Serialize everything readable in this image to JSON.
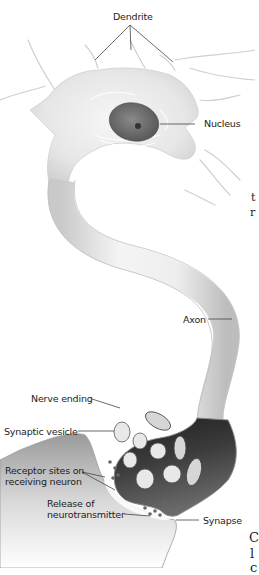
{
  "diagram": {
    "labels": {
      "dendrite": "Dendrite",
      "nucleus": "Nucleus",
      "axon": "Axon",
      "nerve_ending": "Nerve ending",
      "synaptic_vesicle": "Synaptic vesicle",
      "receptor_sites_line1": "Receptor sites on",
      "receptor_sites_line2": "receiving neuron",
      "release_line1": "Release of",
      "release_line2": "neurotransmitter",
      "synapse": "Synapse"
    },
    "edge_text_fragments": [
      "t",
      "r",
      "C",
      "l",
      "c"
    ],
    "colors": {
      "background": "#ffffff",
      "cell_body": "#ececec",
      "cell_shade": "#c8c8c8",
      "nucleus": "#6e6e6e",
      "nerve_ending_dark": "#3a3a3a",
      "vesicle": "#e8e8e8",
      "label_text": "#222222",
      "leader_line": "#444444"
    }
  }
}
